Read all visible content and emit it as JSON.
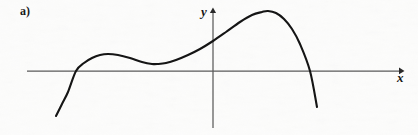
{
  "figure": {
    "panel_label": "a)",
    "background_color": "#fdfdfc",
    "ink_color": "#151515",
    "axis_color": "#5a5a5a",
    "width": 418,
    "height": 135
  },
  "axes": {
    "x": {
      "label": "x",
      "label_style": "italic",
      "line_y": 71,
      "line_x_start": 27,
      "line_x_end": 403,
      "arrow": "right"
    },
    "y": {
      "label": "y",
      "label_style": "italic",
      "line_x": 213,
      "line_y_start": 8,
      "line_y_end": 128,
      "arrow": "up"
    }
  },
  "chart_data": {
    "type": "line",
    "title": "",
    "subtitle": "",
    "xlabel": "x",
    "ylabel": "y",
    "grid": false,
    "legend": "none",
    "annotations": [
      "a)"
    ],
    "axis_origin_px": {
      "x": 213,
      "y": 71
    },
    "xlim_px": [
      27,
      403
    ],
    "ylim_px": [
      8,
      128
    ],
    "series": [
      {
        "name": "curve",
        "stroke": "#151515",
        "stroke_width": 2.1,
        "x_px": [
          56,
          62,
          68,
          76,
          84,
          92,
          100,
          108,
          118,
          130,
          142,
          152,
          158,
          166,
          176,
          188,
          200,
          213,
          226,
          240,
          252,
          262,
          268,
          276,
          284,
          292,
          300,
          310,
          317
        ],
        "y_px": [
          116,
          104,
          92,
          71,
          63,
          58,
          55,
          54,
          55,
          58,
          62,
          64,
          64,
          63,
          60,
          55,
          49,
          41,
          32,
          22,
          15,
          12,
          11,
          13,
          19,
          29,
          44,
          71,
          107
        ],
        "key_points": [
          {
            "role": "start",
            "x": 56,
            "y": 116
          },
          {
            "role": "x-intercept",
            "x": 76,
            "y": 71
          },
          {
            "role": "local-maximum",
            "x": 108,
            "y": 54
          },
          {
            "role": "local-minimum",
            "x": 158,
            "y": 64
          },
          {
            "role": "y-axis-crossing",
            "x": 213,
            "y": 41
          },
          {
            "role": "global-maximum",
            "x": 268,
            "y": 11
          },
          {
            "role": "x-intercept",
            "x": 310,
            "y": 71
          },
          {
            "role": "end",
            "x": 317,
            "y": 107
          }
        ]
      }
    ]
  }
}
